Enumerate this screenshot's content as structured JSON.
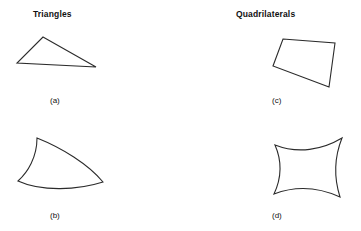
{
  "figure": {
    "background_color": "#ffffff",
    "stroke_color": "#2b2b2b",
    "columns": [
      {
        "id": "triangles",
        "title": "Triangles"
      },
      {
        "id": "quadrilaterals",
        "title": "Quadrilaterals"
      }
    ],
    "shapes": [
      {
        "id": "shape-a",
        "caption": "(a)",
        "category": "Triangles",
        "description": "straight-sided scalene triangle",
        "vertices": [
          [
            43,
            37
          ],
          [
            96,
            67
          ],
          [
            17,
            63
          ]
        ],
        "curved": false
      },
      {
        "id": "shape-b",
        "caption": "(b)",
        "category": "Triangles",
        "description": "curvilinear triangle with three curved sides",
        "vertices": [
          [
            37,
            138
          ],
          [
            103,
            182
          ],
          [
            18,
            181
          ]
        ],
        "curved": true
      },
      {
        "id": "shape-c",
        "caption": "(c)",
        "category": "Quadrilaterals",
        "description": "straight-sided convex quadrilateral",
        "vertices": [
          [
            283,
            39
          ],
          [
            335,
            43
          ],
          [
            329,
            87
          ],
          [
            273,
            66
          ]
        ],
        "curved": false
      },
      {
        "id": "shape-d",
        "caption": "(d)",
        "category": "Quadrilaterals",
        "description": "curvilinear quadrilateral with concave top and bottom, convex left and right",
        "vertices": [
          [
            275,
            145
          ],
          [
            342,
            138
          ],
          [
            340,
            197
          ],
          [
            274,
            194
          ]
        ],
        "curved": true
      }
    ]
  }
}
